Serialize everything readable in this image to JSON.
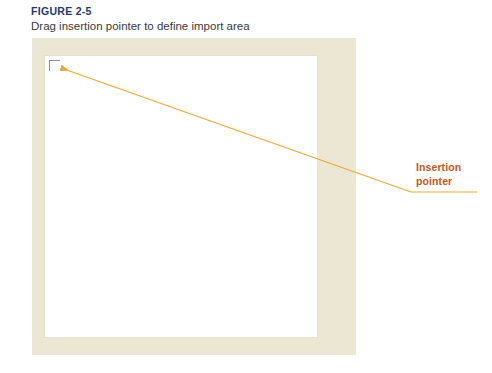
{
  "figure": {
    "number": "FIGURE 2-5",
    "caption": "Drag insertion pointer to define import area"
  },
  "callout": {
    "line1": "Insertion",
    "line2": "pointer"
  },
  "pointer": {
    "icon": "corner-bracket-icon"
  },
  "colors": {
    "figure_number": "#1f3a6e",
    "caption": "#3a3a3a",
    "frame": "#ece7d2",
    "canvas": "#ffffff",
    "canvas_border": "#e4e0cf",
    "leader_line": "#e8a93a",
    "callout_text": "#c1581b",
    "pointer": "#8d8d93",
    "page_background": "#ffffff"
  }
}
